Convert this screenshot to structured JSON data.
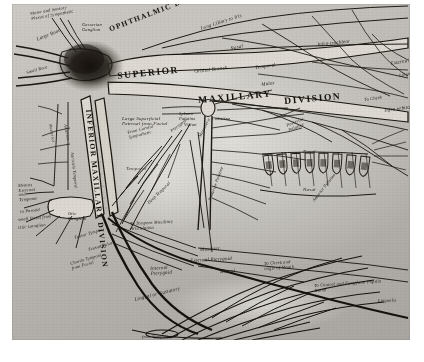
{
  "plate": {
    "subject": "trigeminal-nerve-engraving",
    "ink_color": "#1d1a17",
    "paper_color": "#c2bfba"
  },
  "divisions": [
    {
      "name": "OPHTHALMIC DIVISION",
      "x": 96,
      "y": 22,
      "rot": -21,
      "size": "caps-sm"
    },
    {
      "name": "SUPERIOR",
      "x": 105,
      "y": 68,
      "rot": -6,
      "size": "caps"
    },
    {
      "name": "MAXILLARY",
      "x": 186,
      "y": 92,
      "rot": -5,
      "size": "caps"
    },
    {
      "name": "DIVISION",
      "x": 272,
      "y": 93,
      "rot": -5,
      "size": "caps"
    },
    {
      "name": "INFERIOR MAXILLARY DIVISION",
      "x": 80,
      "y": 105,
      "rot": 84,
      "size": "caps-sm"
    }
  ],
  "labels": [
    {
      "text": "Motor and Sensory\nPlexus of Sympathetic",
      "x": 18,
      "y": 8,
      "rot": -10,
      "cls": "script2"
    },
    {
      "text": "Gasserian\nGanglion",
      "x": 70,
      "y": 19,
      "rot": 0,
      "cls": "script2"
    },
    {
      "text": "Large Root",
      "x": 24,
      "y": 33,
      "rot": -22,
      "cls": "script"
    },
    {
      "text": "Small Root",
      "x": 14,
      "y": 67,
      "rot": -16,
      "cls": "script2"
    },
    {
      "text": "Long Ciliary to Iris",
      "x": 188,
      "y": 22,
      "rot": -18,
      "cls": "script"
    },
    {
      "text": "Nasal",
      "x": 218,
      "y": 42,
      "rot": -12,
      "cls": "script"
    },
    {
      "text": "Infra-trochlear",
      "x": 305,
      "y": 38,
      "rot": -6,
      "cls": "script"
    },
    {
      "text": "Orbital Branch",
      "x": 182,
      "y": 65,
      "rot": -7,
      "cls": "script"
    },
    {
      "text": "Temporal",
      "x": 243,
      "y": 61,
      "rot": -8,
      "cls": "script"
    },
    {
      "text": "Malar",
      "x": 249,
      "y": 78,
      "rot": -8,
      "cls": "script"
    },
    {
      "text": "External",
      "x": 378,
      "y": 57,
      "rot": -10,
      "cls": "script"
    },
    {
      "text": "Lingual",
      "x": 387,
      "y": 70,
      "rot": -12,
      "cls": "script2"
    },
    {
      "text": "To Cheek",
      "x": 352,
      "y": 94,
      "rot": -8,
      "cls": "script2"
    },
    {
      "text": "Infra orbital",
      "x": 372,
      "y": 104,
      "rot": -8,
      "cls": "script"
    },
    {
      "text": "Large Superficial\nPetrosal from Facial",
      "x": 110,
      "y": 112,
      "rot": 0,
      "cls": "script"
    },
    {
      "text": "Spheno\nPalatine",
      "x": 167,
      "y": 108,
      "rot": 0,
      "cls": "script2"
    },
    {
      "text": "Vidian",
      "x": 172,
      "y": 119,
      "rot": 0,
      "cls": "script2"
    },
    {
      "text": "Palatine",
      "x": 200,
      "y": 112,
      "rot": 0,
      "cls": "script"
    },
    {
      "text": "Posterior\nPalatine",
      "x": 274,
      "y": 120,
      "rot": -22,
      "cls": "script2"
    },
    {
      "text": "From Carotid\nSympathetic",
      "x": 115,
      "y": 127,
      "rot": -14,
      "cls": "script2"
    },
    {
      "text": "Pterygoid",
      "x": 158,
      "y": 126,
      "rot": -38,
      "cls": "script2"
    },
    {
      "text": "Masseteric",
      "x": 186,
      "y": 132,
      "rot": -62,
      "cls": "script2"
    },
    {
      "text": "Temporal",
      "x": 114,
      "y": 162,
      "rot": 0,
      "cls": "script faded"
    },
    {
      "text": "Nasal",
      "x": 291,
      "y": 145,
      "rot": 0,
      "cls": "script"
    },
    {
      "text": "Nasal",
      "x": 291,
      "y": 183,
      "rot": 0,
      "cls": "script"
    },
    {
      "text": "Anterior Palatine",
      "x": 300,
      "y": 196,
      "rot": -52,
      "cls": "script2"
    },
    {
      "text": "Deep Temporal",
      "x": 135,
      "y": 198,
      "rot": -44,
      "cls": "script2"
    },
    {
      "text": "To Temporo Maxillary\nArticulation",
      "x": 118,
      "y": 218,
      "rot": -3,
      "cls": "script2"
    },
    {
      "text": "Posterior Palatine",
      "x": 196,
      "y": 196,
      "rot": -70,
      "cls": "script2"
    },
    {
      "text": "Masseter",
      "x": 188,
      "y": 243,
      "rot": -4,
      "cls": "script"
    },
    {
      "text": "External Pterygoid",
      "x": 178,
      "y": 254,
      "rot": -3,
      "cls": "script"
    },
    {
      "text": "Buccal",
      "x": 208,
      "y": 265,
      "rot": -3,
      "cls": "script"
    },
    {
      "text": "Internal\nPterygoid",
      "x": 138,
      "y": 262,
      "rot": -4,
      "cls": "script"
    },
    {
      "text": "Lingual or Gustatory",
      "x": 122,
      "y": 293,
      "rot": -14,
      "cls": "script"
    },
    {
      "text": "from Sympathetic",
      "x": 130,
      "y": 331,
      "rot": 0,
      "cls": "script2"
    },
    {
      "text": "To Cheek and\nangle of Mouth",
      "x": 252,
      "y": 258,
      "rot": -4,
      "cls": "script2"
    },
    {
      "text": "To Conical and Fungiform Papilla\nDorsa",
      "x": 302,
      "y": 280,
      "rot": -4,
      "cls": "script2"
    },
    {
      "text": "Lingualis",
      "x": 366,
      "y": 295,
      "rot": -2,
      "cls": "script2"
    },
    {
      "text": "Otic\nGanglion",
      "x": 56,
      "y": 208,
      "rot": 0,
      "cls": "script2"
    },
    {
      "text": "Auriculo Temporal",
      "x": 62,
      "y": 148,
      "rot": 84,
      "cls": "script2"
    },
    {
      "text": "Posterior",
      "x": 40,
      "y": 120,
      "rot": 80,
      "cls": "script2"
    },
    {
      "text": "Anterior",
      "x": 55,
      "y": 120,
      "rot": 80,
      "cls": "script2"
    },
    {
      "text": "Meatus\nExternal\nand\nTympanic",
      "x": 6,
      "y": 180,
      "rot": -4,
      "cls": "script2"
    },
    {
      "text": "to Parotid",
      "x": 8,
      "y": 206,
      "rot": -6,
      "cls": "script2"
    },
    {
      "text": "small facial from",
      "x": 6,
      "y": 214,
      "rot": -6,
      "cls": "script2"
    },
    {
      "text": "Otic Ganglion",
      "x": 6,
      "y": 222,
      "rot": -6,
      "cls": "script2"
    },
    {
      "text": "Tensor Tympani",
      "x": 62,
      "y": 232,
      "rot": -16,
      "cls": "script2"
    },
    {
      "text": "Tensor Palati",
      "x": 76,
      "y": 244,
      "rot": -16,
      "cls": "script2"
    },
    {
      "text": "Chorda Tympani\nfrom Facial",
      "x": 58,
      "y": 258,
      "rot": -16,
      "cls": "script2"
    }
  ],
  "teeth": {
    "count": 8,
    "label": "dental-arch"
  }
}
